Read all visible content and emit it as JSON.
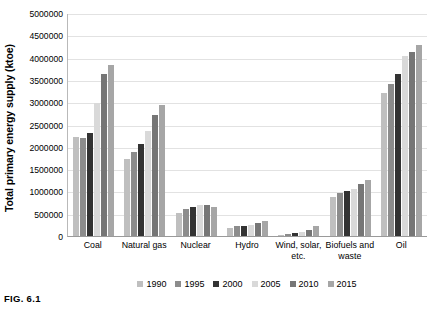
{
  "caption": "FIG. 6.1",
  "chart_data": {
    "type": "bar",
    "title": "",
    "xlabel": "",
    "ylabel": "Total primary energy supply (ktoe)",
    "ylim": [
      0,
      5000000
    ],
    "grid": true,
    "legend_position": "bottom",
    "ytick_labels": [
      "5000000",
      "4500000",
      "4000000",
      "3500000",
      "3000000",
      "2500000",
      "2000000",
      "1500000",
      "1000000",
      "500000",
      "0"
    ],
    "ytick_values": [
      5000000,
      4500000,
      4000000,
      3500000,
      3000000,
      2500000,
      2000000,
      1500000,
      1000000,
      500000,
      0
    ],
    "categories": [
      "Coal",
      "Natural gas",
      "Nuclear",
      "Hydro",
      "Wind, solar, etc.",
      "Biofuels and waste",
      "Oil"
    ],
    "series": [
      {
        "name": "1990",
        "color": "#bfbfbf",
        "values": [
          2210000,
          1720000,
          525000,
          185000,
          30000,
          880000,
          3210000
        ]
      },
      {
        "name": "1995",
        "color": "#8c8c8c",
        "values": [
          2190000,
          1880000,
          600000,
          220000,
          42000,
          960000,
          3400000
        ]
      },
      {
        "name": "2000",
        "color": "#333333",
        "values": [
          2300000,
          2060000,
          655000,
          225000,
          60000,
          1000000,
          3640000
        ]
      },
      {
        "name": "2005",
        "color": "#d9d9d9",
        "values": [
          2990000,
          2350000,
          690000,
          250000,
          80000,
          1060000,
          4030000
        ]
      },
      {
        "name": "2010",
        "color": "#767676",
        "values": [
          3640000,
          2710000,
          690000,
          290000,
          130000,
          1170000,
          4120000
        ]
      },
      {
        "name": "2015",
        "color": "#a6a6a6",
        "values": [
          3830000,
          2940000,
          660000,
          330000,
          225000,
          1250000,
          4280000
        ]
      }
    ]
  }
}
